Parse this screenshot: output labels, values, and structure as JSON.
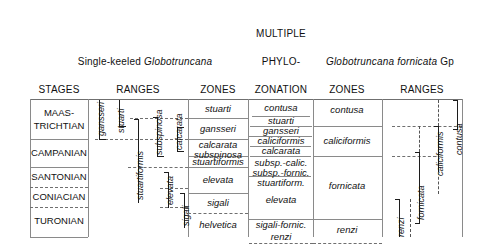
{
  "figure": {
    "type": "biostratigraphic-correlation-chart"
  },
  "headers": {
    "stages": "STAGES",
    "group_single_keeled": {
      "prefix": "Single-keeled ",
      "genus": "Globotruncana"
    },
    "ranges_left": "RANGES",
    "zones_left": "ZONES",
    "multiple_phylozonation": [
      "MULTIPLE",
      "PHYLO-",
      "ZONATION"
    ],
    "group_fornicata": {
      "genus_species": "Globotruncana fornicata",
      "suffix": " Gp"
    },
    "zones_right": "ZONES",
    "ranges_right": "RANGES"
  },
  "stages": [
    {
      "label": "MAAS-\nTRICHTIAN",
      "line1": "MAAS-",
      "line2": "TRICHTIAN",
      "top": 47,
      "bottom": 87,
      "boundary_style": "solid"
    },
    {
      "label": "CAMPANIAN",
      "line1": "CAMPANIAN",
      "line2": "",
      "top": 87,
      "bottom": 127,
      "boundary_style": "solid"
    },
    {
      "label": "SANTONIAN",
      "line1": "SANTONIAN",
      "line2": "",
      "top": 127,
      "bottom": 167,
      "boundary_style": "dashed"
    },
    {
      "label": "CONIACIAN",
      "line1": "CONIACIAN",
      "line2": "",
      "top": 167,
      "bottom": 187,
      "boundary_style": "dashed"
    },
    {
      "label": "TURONIAN",
      "line1": "TURONIAN",
      "line2": "",
      "top": 187,
      "bottom": 237,
      "boundary_style": "solid"
    }
  ],
  "ranges_left_taxa": [
    {
      "name": "gansseri",
      "top": 47,
      "bottom": 86,
      "x": 92
    },
    {
      "name": "stuarti",
      "top": 47,
      "bottom": 72,
      "x": 112
    },
    {
      "name": "stuartiformis",
      "top": 66,
      "bottom": 150,
      "x": 131
    },
    {
      "name": "subspinosa",
      "top": 64,
      "bottom": 103,
      "x": 150
    },
    {
      "name": "elevata",
      "top": 136,
      "bottom": 172,
      "x": 163
    },
    {
      "name": "calcarata",
      "top": 72,
      "bottom": 96,
      "x": 172
    },
    {
      "name": "sigali",
      "top": 165,
      "bottom": 200,
      "x": 180
    }
  ],
  "zones_left": [
    {
      "name": "stuarti",
      "top": 47,
      "bottom": 68
    },
    {
      "name": "gansseri",
      "top": 68,
      "bottom": 86
    },
    {
      "name": "calcarata",
      "top": 86,
      "bottom": 96,
      "stacked_with": "subspinosa"
    },
    {
      "name": "subspinosa",
      "top": 96,
      "bottom": 106
    },
    {
      "name": "stuartiformis",
      "top": 106,
      "bottom": 124
    },
    {
      "name": "elevata",
      "top": 124,
      "bottom": 168
    },
    {
      "name": "sigali",
      "top": 168,
      "bottom": 205
    },
    {
      "name": "helvetica",
      "top": 205,
      "bottom": 237
    }
  ],
  "multiple_phylozonation": [
    {
      "name": "contusa",
      "top": 47,
      "bottom": 65,
      "divider": "solid"
    },
    {
      "name": "stuarti",
      "top": 65,
      "bottom": 75,
      "divider": "solid"
    },
    {
      "name": "gansseri",
      "top": 75,
      "bottom": 85,
      "divider": "none"
    },
    {
      "name": "caliciformis",
      "top": 85,
      "bottom": 95,
      "divider": "solid"
    },
    {
      "name": "calcarata",
      "top": 95,
      "bottom": 105,
      "divider": "solid"
    },
    {
      "name": "subsp.-calic.",
      "top": 105,
      "bottom": 116,
      "divider": "solid"
    },
    {
      "name": "subsp.-fornic.",
      "top": 116,
      "bottom": 126,
      "divider": "none"
    },
    {
      "name": "stuartiform.",
      "top": 126,
      "bottom": 136,
      "divider": "solid"
    },
    {
      "name": "elevata",
      "top": 136,
      "bottom": 176,
      "divider": "none"
    },
    {
      "name": "sigali-fornic.",
      "top": 176,
      "bottom": 190,
      "divider": "solid"
    },
    {
      "name": "renzi",
      "top": 190,
      "bottom": 205,
      "divider": "none"
    }
  ],
  "zones_right": [
    {
      "name": "contusa",
      "top": 47,
      "bottom": 72
    },
    {
      "name": "caliciformis",
      "top": 72,
      "bottom": 106
    },
    {
      "name": "fornicata",
      "top": 106,
      "bottom": 186
    },
    {
      "name": "renzi",
      "top": 186,
      "bottom": 210
    }
  ],
  "ranges_right_taxa": [
    {
      "name": "renzi",
      "top": 166,
      "bottom": 205,
      "x": 398
    },
    {
      "name": "fornicata",
      "top": 100,
      "bottom": 195,
      "x": 408
    },
    {
      "name": "caliciformis",
      "top": 72,
      "bottom": 130,
      "x": 430
    },
    {
      "name": "contusa",
      "top": 47,
      "bottom": 75,
      "x": 452
    }
  ],
  "colors": {
    "rule": "#8a8a8a",
    "dashed_rule": "#6f6f6f",
    "range_bar": "#1c1c1c",
    "text": "#111111",
    "background": "#ffffff"
  },
  "column_x": {
    "stages_left": 30,
    "stages_right": 88,
    "ranges_left_right": 188,
    "zones_left_right": 248,
    "phylo_right": 313,
    "zones_right_right": 382,
    "ranges_right_right": 462
  }
}
